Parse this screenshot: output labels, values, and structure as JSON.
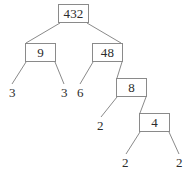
{
  "figure": {
    "kind": "factor-tree",
    "width": 193,
    "height": 181,
    "background_color": "#ffffff",
    "box_border_color": "#8a8a8a",
    "edge_color": "#8a8a8a",
    "text_color": "#2b2b2b"
  },
  "chart_data": {
    "type": "diagram",
    "title": "",
    "diagram_type": "factor tree",
    "root": "432",
    "nodes": [
      {
        "id": "n432",
        "label": "432",
        "boxed": true,
        "x": 58,
        "y": 4,
        "w": 31,
        "h": 19
      },
      {
        "id": "n9",
        "label": "9",
        "boxed": true,
        "x": 25,
        "y": 43,
        "w": 31,
        "h": 19
      },
      {
        "id": "n48",
        "label": "48",
        "boxed": true,
        "x": 92,
        "y": 43,
        "w": 31,
        "h": 19
      },
      {
        "id": "l3a",
        "label": "3",
        "boxed": false,
        "x": 9,
        "y": 86
      },
      {
        "id": "l3b",
        "label": "3",
        "boxed": false,
        "x": 61,
        "y": 86
      },
      {
        "id": "l6",
        "label": "6",
        "boxed": false,
        "x": 77,
        "y": 86
      },
      {
        "id": "n8",
        "label": "8",
        "boxed": true,
        "x": 116,
        "y": 78,
        "w": 31,
        "h": 19
      },
      {
        "id": "l2a",
        "label": "2",
        "boxed": false,
        "x": 97,
        "y": 119
      },
      {
        "id": "n4",
        "label": "4",
        "boxed": true,
        "x": 139,
        "y": 113,
        "w": 31,
        "h": 19
      },
      {
        "id": "l2b",
        "label": "2",
        "boxed": false,
        "x": 122,
        "y": 156
      },
      {
        "id": "l2c",
        "label": "2",
        "boxed": false,
        "x": 176,
        "y": 156
      }
    ],
    "edges": [
      {
        "from": "n432",
        "to": "n9",
        "x1": 60,
        "y1": 23,
        "x2": 26,
        "y2": 43
      },
      {
        "from": "n432",
        "to": "n48",
        "x1": 87,
        "y1": 23,
        "x2": 121,
        "y2": 43
      },
      {
        "from": "n9",
        "to": "l3a",
        "x1": 26,
        "y1": 62,
        "x2": 12,
        "y2": 84
      },
      {
        "from": "n9",
        "to": "l3b",
        "x1": 55,
        "y1": 62,
        "x2": 64,
        "y2": 84
      },
      {
        "from": "n48",
        "to": "l6",
        "x1": 93,
        "y1": 62,
        "x2": 80,
        "y2": 84
      },
      {
        "from": "n48",
        "to": "n8",
        "x1": 122,
        "y1": 62,
        "x2": 117,
        "y2": 78
      },
      {
        "from": "n8",
        "to": "l2a",
        "x1": 117,
        "y1": 97,
        "x2": 101,
        "y2": 117
      },
      {
        "from": "n8",
        "to": "n4",
        "x1": 146,
        "y1": 97,
        "x2": 140,
        "y2": 113
      },
      {
        "from": "n4",
        "to": "l2b",
        "x1": 140,
        "y1": 132,
        "x2": 126,
        "y2": 154
      },
      {
        "from": "n4",
        "to": "l2c",
        "x1": 169,
        "y1": 132,
        "x2": 179,
        "y2": 154
      }
    ],
    "leaf_values": [
      "3",
      "3",
      "6",
      "2",
      "2",
      "2"
    ],
    "branch_values": [
      "432",
      "9",
      "48",
      "8",
      "4"
    ]
  }
}
